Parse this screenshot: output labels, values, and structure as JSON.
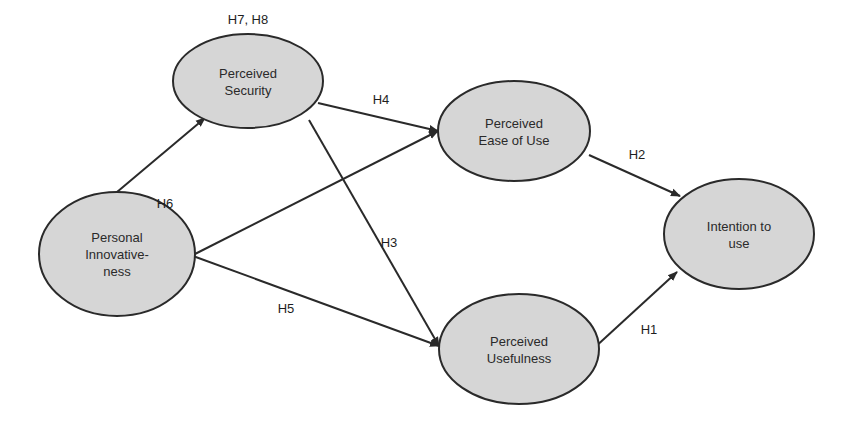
{
  "diagram": {
    "type": "structural-model",
    "nodes": [
      {
        "id": "security",
        "lines": [
          "Perceived",
          "Security"
        ],
        "cx": 248,
        "cy": 81,
        "rx": 75,
        "ry": 47,
        "label_top": "H7, H8"
      },
      {
        "id": "innovativeness",
        "lines": [
          "Personal",
          "Innovative-",
          "ness"
        ],
        "cx": 117,
        "cy": 254,
        "rx": 78,
        "ry": 62
      },
      {
        "id": "ease",
        "lines": [
          "Perceived",
          "Ease of Use"
        ],
        "cx": 514,
        "cy": 131,
        "rx": 76,
        "ry": 50
      },
      {
        "id": "intention",
        "lines": [
          "Intention to",
          "use"
        ],
        "cx": 739,
        "cy": 234,
        "rx": 75,
        "ry": 55
      },
      {
        "id": "usefulness",
        "lines": [
          "Perceived",
          "Usefulness"
        ],
        "cx": 519,
        "cy": 349,
        "rx": 80,
        "ry": 55
      }
    ],
    "edges": [
      {
        "from": "innovativeness",
        "to": "security",
        "label": "",
        "x1": 117,
        "y1": 192,
        "x2": 205,
        "y2": 118
      },
      {
        "from": "security",
        "to": "ease",
        "label": "H4",
        "x1": 318,
        "y1": 103,
        "x2": 438,
        "y2": 131,
        "lx": 381,
        "ly": 104
      },
      {
        "from": "innovativeness",
        "to": "ease",
        "label": "H6",
        "x1": 193,
        "y1": 255,
        "x2": 438,
        "y2": 131,
        "lx": 165,
        "ly": 208
      },
      {
        "from": "security",
        "to": "usefulness",
        "label": "H3",
        "x1": 309,
        "y1": 120,
        "x2": 439,
        "y2": 346,
        "lx": 389,
        "ly": 247
      },
      {
        "from": "innovativeness",
        "to": "usefulness",
        "label": "H5",
        "x1": 193,
        "y1": 256,
        "x2": 439,
        "y2": 346,
        "lx": 286,
        "ly": 313
      },
      {
        "from": "ease",
        "to": "intention",
        "label": "H2",
        "x1": 589,
        "y1": 155,
        "x2": 680,
        "y2": 196,
        "lx": 637,
        "ly": 159
      },
      {
        "from": "usefulness",
        "to": "intention",
        "label": "H1",
        "x1": 593,
        "y1": 349,
        "x2": 677,
        "y2": 272,
        "lx": 649,
        "ly": 334
      }
    ]
  }
}
